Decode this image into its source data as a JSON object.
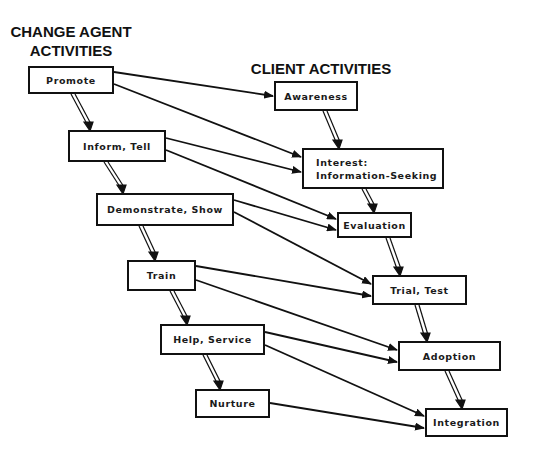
{
  "headings": {
    "change_agent": "CHANGE AGENT\nACTIVITIES",
    "change_agent_line1": "CHANGE AGENT",
    "change_agent_line2": "ACTIVITIES",
    "client": "CLIENT ACTIVITIES"
  },
  "change_agent_activities": [
    {
      "id": "promote",
      "label": "Promote"
    },
    {
      "id": "inform",
      "label": "Inform, Tell"
    },
    {
      "id": "demonstrate",
      "label": "Demonstrate, Show"
    },
    {
      "id": "train",
      "label": "Train"
    },
    {
      "id": "help",
      "label": "Help, Service"
    },
    {
      "id": "nurture",
      "label": "Nurture"
    }
  ],
  "client_activities": [
    {
      "id": "awareness",
      "label": "Awareness"
    },
    {
      "id": "interest",
      "label": "Interest:",
      "label2": "Information-Seeking"
    },
    {
      "id": "evaluation",
      "label": "Evaluation"
    },
    {
      "id": "trial",
      "label": "Trial, Test"
    },
    {
      "id": "adoption",
      "label": "Adoption"
    },
    {
      "id": "integration",
      "label": "Integration"
    }
  ],
  "edges": {
    "sequence_double_arrows": [
      [
        "promote",
        "inform"
      ],
      [
        "inform",
        "demonstrate"
      ],
      [
        "demonstrate",
        "train"
      ],
      [
        "train",
        "help"
      ],
      [
        "help",
        "nurture"
      ],
      [
        "awareness",
        "interest"
      ],
      [
        "interest",
        "evaluation"
      ],
      [
        "evaluation",
        "trial"
      ],
      [
        "trial",
        "adoption"
      ],
      [
        "adoption",
        "integration"
      ]
    ],
    "influence_arrows": [
      [
        "promote",
        "awareness"
      ],
      [
        "promote",
        "interest"
      ],
      [
        "inform",
        "interest"
      ],
      [
        "inform",
        "evaluation"
      ],
      [
        "demonstrate",
        "evaluation"
      ],
      [
        "demonstrate",
        "trial"
      ],
      [
        "train",
        "trial"
      ],
      [
        "train",
        "adoption"
      ],
      [
        "help",
        "adoption"
      ],
      [
        "help",
        "integration"
      ],
      [
        "nurture",
        "integration"
      ]
    ]
  }
}
